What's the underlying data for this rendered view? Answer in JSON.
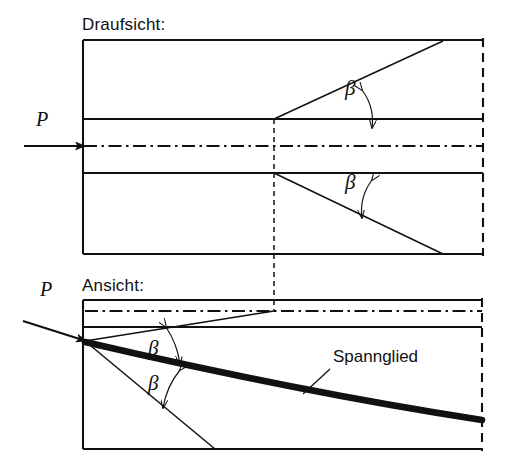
{
  "figure": {
    "type": "engineering-drawing",
    "line_color": "#111111",
    "background": "#ffffff"
  },
  "views": {
    "plan": {
      "label": "Draufsicht:",
      "label_x": 82,
      "label_y": 16,
      "box": {
        "x": 83,
        "y": 40,
        "width": 400,
        "height": 214
      },
      "right_edge_style": "dashed",
      "duct_top_y": 119,
      "duct_bottom_y": 173,
      "centerline_y": 146,
      "section_line_x": 274,
      "load_label": "P",
      "load_label_x": 36,
      "load_label_y": 110,
      "load_arrow": {
        "x1": 24,
        "y1": 146,
        "x2": 85,
        "y2": 146
      },
      "splay_upper": {
        "x1": 274,
        "y1": 119,
        "x2": 443,
        "y2": 41
      },
      "splay_lower": {
        "x1": 274,
        "y1": 173,
        "x2": 443,
        "y2": 254
      },
      "angle_upper_label": "β",
      "angle_upper_label_x": 345,
      "angle_upper_label_y": 88,
      "angle_lower_label": "β",
      "angle_lower_label_x": 345,
      "angle_lower_label_y": 181
    },
    "elevation": {
      "label": "Ansicht:",
      "label_x": 82,
      "label_y": 277,
      "box": {
        "x": 83,
        "y": 300,
        "width": 399,
        "height": 149
      },
      "right_edge_style": "dashed",
      "centerline_y": 311,
      "duct_bottom_y": 327,
      "section_line_x": 274,
      "load_label": "P",
      "load_label_x": 40,
      "load_label_y": 280,
      "load_arrow": {
        "x1": 23,
        "y1": 321,
        "x2": 86,
        "y2": 341
      },
      "anchor_point": {
        "x": 85,
        "y": 341
      },
      "splay_upper": {
        "x1": 85,
        "y1": 341,
        "x2": 274,
        "y2": 311
      },
      "splay_lower": {
        "x1": 85,
        "y1": 341,
        "x2": 215,
        "y2": 449
      },
      "tendon_label": "Spannglied",
      "tendon_label_x": 333,
      "tendon_label_y": 348,
      "tendon_leader": {
        "x1": 330,
        "y1": 369,
        "x2": 303,
        "y2": 394
      },
      "tendon_curve": {
        "x1": 85,
        "y1": 342,
        "cx": 300,
        "cy": 392,
        "x2": 482,
        "y2": 420
      },
      "angle_upper_label": "β",
      "angle_upper_label_x": 148,
      "angle_upper_label_y": 347,
      "angle_lower_label": "β",
      "angle_lower_label_x": 148,
      "angle_lower_label_y": 382
    }
  },
  "annotations": {
    "angle_symbol": "β",
    "load_symbol": "P",
    "tendon_name": "Spannglied"
  }
}
